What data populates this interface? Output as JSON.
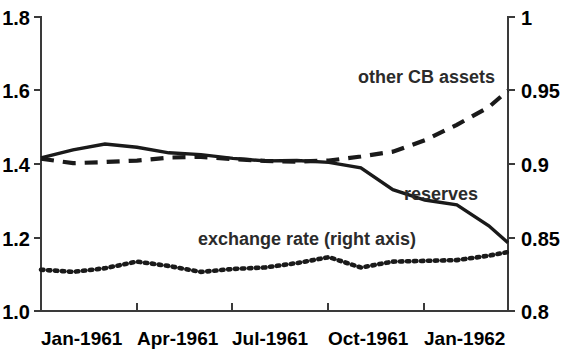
{
  "chart_data": {
    "type": "line",
    "title": "",
    "xlabel": "",
    "ylabel": "",
    "grid": false,
    "legend_position": "inline-annotations",
    "x_tick_labels": [
      "Jan-1961",
      "Apr-1961",
      "Jul-1961",
      "Oct-1961",
      "Jan-1962"
    ],
    "x_tick_months": [
      0,
      3,
      6,
      9,
      12
    ],
    "x_range_months": [
      0,
      14.6
    ],
    "left_axis": {
      "ticks": [
        "1.0",
        "1.2",
        "1.4",
        "1.6",
        "1.8"
      ],
      "values": [
        1.0,
        1.2,
        1.4,
        1.6,
        1.8
      ],
      "ylim": [
        1.0,
        1.8
      ]
    },
    "right_axis": {
      "ticks": [
        "0.8",
        "0.85",
        "0.9",
        "0.95",
        "1"
      ],
      "values": [
        0.8,
        0.85,
        0.9,
        0.95,
        1.0
      ],
      "ylim": [
        0.8,
        1.0
      ]
    },
    "series": [
      {
        "name": "reserves",
        "axis": "left",
        "style": "solid",
        "label": "reserves",
        "x": [
          0,
          1,
          2,
          3,
          4,
          5,
          6,
          7,
          8,
          9,
          10,
          11,
          12,
          13,
          14,
          14.6
        ],
        "values": [
          1.415,
          1.437,
          1.453,
          1.444,
          1.429,
          1.424,
          1.414,
          1.407,
          1.408,
          1.403,
          1.388,
          1.329,
          1.301,
          1.288,
          1.231,
          1.185
        ]
      },
      {
        "name": "other CB assets",
        "axis": "left",
        "style": "dashed",
        "label": "other CB assets",
        "x": [
          0,
          1,
          2,
          3,
          4,
          5,
          6,
          7,
          8,
          9,
          10,
          11,
          12,
          13,
          14,
          14.6
        ],
        "values": [
          1.413,
          1.401,
          1.404,
          1.408,
          1.416,
          1.418,
          1.412,
          1.407,
          1.405,
          1.408,
          1.419,
          1.432,
          1.463,
          1.505,
          1.553,
          1.598
        ]
      },
      {
        "name": "exchange rate (right axis)",
        "axis": "right",
        "style": "dotted",
        "label": "exchange rate (right axis)",
        "x": [
          0,
          1,
          2,
          3,
          4,
          5,
          6,
          7,
          8,
          9,
          10,
          11,
          12,
          13,
          14,
          14.6
        ],
        "values": [
          0.828,
          0.8265,
          0.829,
          0.8335,
          0.8305,
          0.8265,
          0.8285,
          0.8295,
          0.8325,
          0.8365,
          0.8295,
          0.8335,
          0.834,
          0.8345,
          0.8375,
          0.84
        ]
      }
    ],
    "annotations": [
      {
        "name": "other-cb-assets-label",
        "text": "other CB assets",
        "x_px": 358,
        "y_px": 83
      },
      {
        "name": "reserves-label",
        "text": "reserves",
        "x_px": 404,
        "y_px": 200
      },
      {
        "name": "exchange-rate-label",
        "text": "exchange rate (right axis)",
        "x_px": 198,
        "y_px": 245
      }
    ]
  },
  "geometry": {
    "plot_left_px": 41,
    "plot_right_px": 508,
    "plot_top_px": 16,
    "plot_bottom_px": 311
  }
}
